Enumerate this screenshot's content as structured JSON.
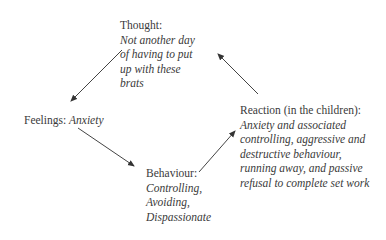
{
  "diagram": {
    "type": "cycle",
    "nodes": {
      "thought": {
        "label": "Thought:",
        "lines": [
          "Not another day",
          "of having to put",
          "up with these",
          "brats"
        ]
      },
      "feelings": {
        "label": "Feelings:",
        "value": "Anxiety"
      },
      "behaviour": {
        "label": "Behaviour:",
        "lines": [
          "Controlling,",
          "Avoiding,",
          "Dispassionate"
        ]
      },
      "reaction": {
        "label": "Reaction (in the children):",
        "lines": [
          "Anxiety and associated",
          "controlling, aggressive and",
          "destructive behaviour,",
          "running away, and passive",
          "refusal to complete set work"
        ]
      }
    },
    "edges": [
      {
        "from": "thought",
        "to": "feelings"
      },
      {
        "from": "feelings",
        "to": "behaviour"
      },
      {
        "from": "behaviour",
        "to": "reaction"
      },
      {
        "from": "reaction",
        "to": "thought"
      }
    ],
    "colors": {
      "text": "#3a3a3a",
      "arrow": "#333333",
      "background": "#ffffff"
    }
  }
}
